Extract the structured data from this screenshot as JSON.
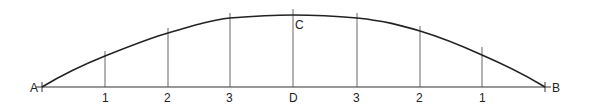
{
  "diagram": {
    "type": "arc-construction",
    "points": {
      "A": {
        "label": "A",
        "x": 42,
        "y": 87
      },
      "B": {
        "label": "B",
        "x": 545,
        "y": 87
      },
      "C": {
        "label": "C",
        "x": 293,
        "y": 15
      },
      "D": {
        "label": "D",
        "x": 293,
        "y": 87
      }
    },
    "baseline_ticks": [
      {
        "label": "1",
        "x": 105,
        "top": 56
      },
      {
        "label": "2",
        "x": 168,
        "top": 32
      },
      {
        "label": "3",
        "x": 230,
        "top": 17
      },
      {
        "label": "D",
        "x": 293,
        "top": 10
      },
      {
        "label": "3",
        "x": 357,
        "top": 17
      },
      {
        "label": "2",
        "x": 420,
        "top": 28
      },
      {
        "label": "1",
        "x": 482,
        "top": 49
      }
    ],
    "colors": {
      "line": "#222222",
      "thin": "#555555",
      "background": "#ffffff"
    }
  }
}
